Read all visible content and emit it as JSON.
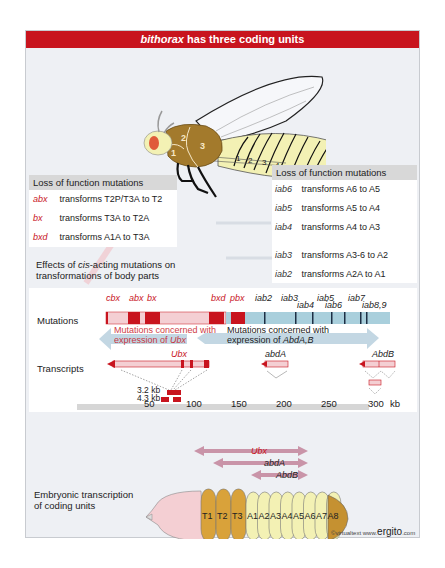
{
  "title": {
    "italic": "bithorax",
    "rest": " has three coding units"
  },
  "fly": {
    "thorax_labels": [
      "1",
      "2",
      "3"
    ],
    "abdomen_labels": [
      "1",
      "2",
      "3",
      "4",
      "5",
      "6",
      "7",
      "8"
    ]
  },
  "left_box": {
    "header": "Loss of function mutations",
    "rows": [
      {
        "mutation": "abx",
        "effect": "transforms T2P/T3A to T2"
      },
      {
        "mutation": "bx",
        "effect": "transforms T3A to T2A"
      },
      {
        "mutation": "bxd",
        "effect": "transforms A1A to T3A"
      }
    ]
  },
  "right_box": {
    "header": "Loss of function mutations",
    "rows": [
      {
        "mutation": "iab6",
        "effect": "transforms A6 to A5"
      },
      {
        "mutation": "iab5",
        "effect": "transforms A5 to A4"
      },
      {
        "mutation": "iab4",
        "effect": "transforms A4 to A3"
      },
      {
        "mutation": "iab3",
        "effect": "transforms A3-6 to A2"
      },
      {
        "mutation": "iab2",
        "effect": "transforms A2A to A1"
      }
    ]
  },
  "effects_caption": {
    "line1_pre": "Effects of ",
    "line1_italic": "cis",
    "line1_post": "-acting mutations on",
    "line2": "transformations of body parts"
  },
  "map": {
    "mutations_label": "Mutations",
    "transcripts_label": "Transcripts",
    "mutation_names_red": [
      "cbx",
      "abx",
      "bx",
      "bxd",
      "pbx"
    ],
    "mutation_names_dark": [
      "iab2",
      "iab3",
      "iab4",
      "iab5",
      "iab6",
      "iab7",
      "iab8,9"
    ],
    "ubx_arrow_text": {
      "line1": "Mutations concerned with",
      "line2_pre": "expression of ",
      "line2_italic": "Ubx"
    },
    "abd_arrow_text": {
      "line1": "Mutations concerned with",
      "line2_pre": "expression of ",
      "line2_italic": "AbdA,B"
    },
    "transcript_names": {
      "ubx": "Ubx",
      "abda": "abdA",
      "abdb": "AbdB"
    },
    "sizes": [
      "3.2 kb",
      "4.3 kb"
    ],
    "scale_ticks": [
      "50",
      "100",
      "150",
      "200",
      "250",
      "300"
    ],
    "scale_unit": "kb"
  },
  "embryo": {
    "caption_line1": "Embryonic transcription",
    "caption_line2": "of coding units",
    "arrows": [
      "Ubx",
      "abdA",
      "AbdB"
    ],
    "segments": [
      "T1",
      "T2",
      "T3",
      "A1",
      "A2",
      "A3",
      "A4",
      "A5",
      "A6",
      "A7",
      "A8"
    ]
  },
  "credit": {
    "prefix": "©virtualtext www.",
    "brand": "ergito",
    "suffix": ".com"
  },
  "colors": {
    "title_red": "#c8141e",
    "mutation_red": "#c8141e",
    "bxc_blue": "#a9cfdc",
    "thorax_brown": "#a37a2c",
    "abdomen_yellow": "#f3f1b4",
    "embryo_orange": "#d9a23a",
    "arrow_pink": "#c994a8"
  }
}
